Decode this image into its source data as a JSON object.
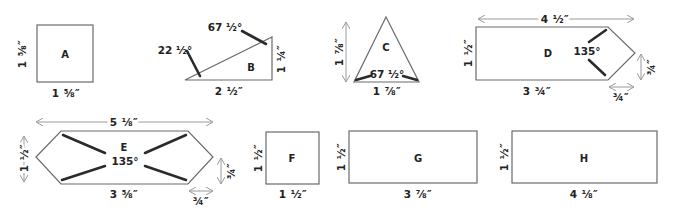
{
  "diagram": {
    "pieces": [
      {
        "id": "A",
        "label": "A",
        "shape": "square",
        "width": "1 ⅝″",
        "height": "1 ⅝″"
      },
      {
        "id": "B",
        "label": "B",
        "shape": "right-triangle",
        "base": "2 ½″",
        "height": "1 ¼″",
        "angles": [
          "22 ½°",
          "67 ½°"
        ]
      },
      {
        "id": "C",
        "label": "C",
        "shape": "isosceles-triangle",
        "base": "1 ⅞″",
        "height": "1 ⅞″",
        "angle": "67 ½°"
      },
      {
        "id": "D",
        "label": "D",
        "shape": "pentagon-point",
        "overall": "4 ½″",
        "height": "1 ½″",
        "base": "3 ¾″",
        "point_height": "¾″",
        "point_width": "¾″",
        "angle": "135°"
      },
      {
        "id": "E",
        "label": "E",
        "shape": "hexagon",
        "overall": "5 ⅛″",
        "height": "1 ½″",
        "base": "3 ⅝″",
        "point_height": "¾″",
        "point_width": "¾″",
        "angle": "135°"
      },
      {
        "id": "F",
        "label": "F",
        "shape": "square",
        "width": "1 ½″",
        "height": "1 ½″"
      },
      {
        "id": "G",
        "label": "G",
        "shape": "rectangle",
        "width": "3 ⅞″",
        "height": "1 ½″"
      },
      {
        "id": "H",
        "label": "H",
        "shape": "rectangle",
        "width": "4 ⅛″",
        "height": "1 ½″"
      }
    ]
  },
  "colors": {
    "outline": "#6a6a6a",
    "angle_mark": "#2b2b2b",
    "arrow": "#9a9a9a",
    "text": "#222222"
  }
}
